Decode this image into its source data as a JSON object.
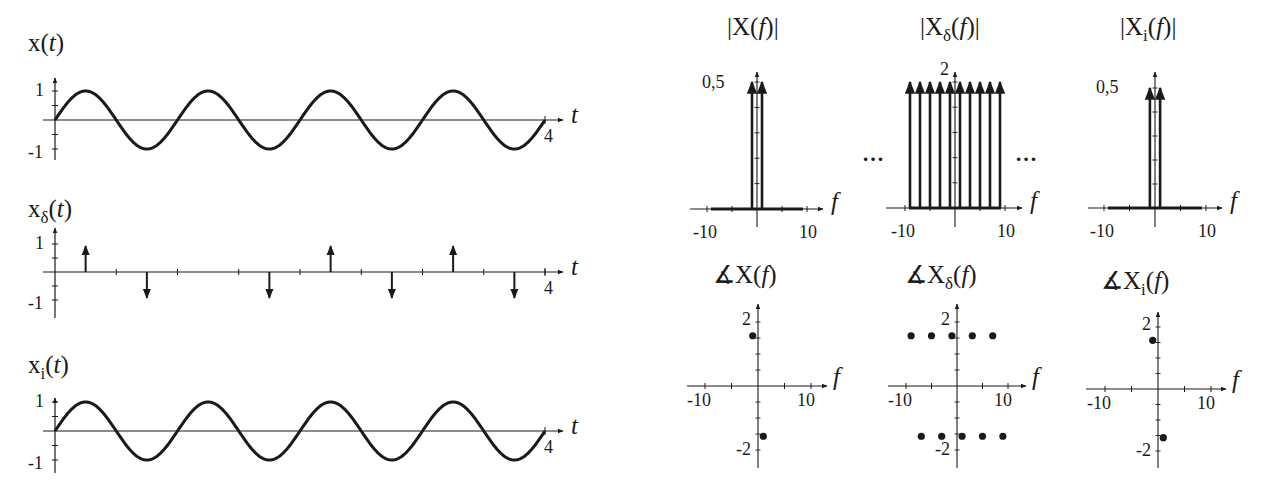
{
  "colors": {
    "ink": "#1a1a1a",
    "axis": "#333333",
    "background": "#ffffff"
  },
  "chart_data": [
    {
      "id": "x_t",
      "type": "line",
      "title": "x(t)",
      "title_base": "x",
      "title_sub": "",
      "title_arg": "t",
      "xlabel": "t",
      "ylabel": "x(t)",
      "xlim": [
        0,
        4
      ],
      "ylim": [
        -1,
        1
      ],
      "x_ticks_labeled": [
        "4"
      ],
      "y_ticks_labeled": [
        "1",
        "-1"
      ],
      "function": "sin(2*pi*1*t)",
      "frequency_hz": 1,
      "amplitude": 1,
      "px": {
        "x0": 55,
        "x1": 545,
        "y0": 120,
        "yUnit": 29,
        "axisEnd": 563,
        "yTop": 78,
        "yBot": 160,
        "titleX": 28,
        "titleY": 30
      }
    },
    {
      "id": "x_delta_t",
      "type": "stem",
      "title": "xδ(t)",
      "title_base": "x",
      "title_sub": "δ",
      "title_arg": "t",
      "xlabel": "t",
      "ylabel": "xδ(t)",
      "xlim": [
        0,
        4
      ],
      "ylim": [
        -1,
        1
      ],
      "x_ticks_labeled": [
        "4"
      ],
      "y_ticks_labeled": [
        "1",
        "-1"
      ],
      "tick_spacing": 0.25,
      "impulses": [
        {
          "t": 0.25,
          "value": 1
        },
        {
          "t": 0.75,
          "value": -1
        },
        {
          "t": 1.75,
          "value": -1
        },
        {
          "t": 2.25,
          "value": 1
        },
        {
          "t": 2.75,
          "value": -1
        },
        {
          "t": 3.25,
          "value": 1
        },
        {
          "t": 3.75,
          "value": -1
        }
      ],
      "px": {
        "x0": 55,
        "x1": 545,
        "y0": 272,
        "yUnit": 28,
        "axisEnd": 563,
        "yTop": 228,
        "yBot": 318,
        "titleX": 28,
        "titleY": 196
      }
    },
    {
      "id": "x_i_t",
      "type": "line",
      "title": "xi(t)",
      "title_base": "x",
      "title_sub": "i",
      "title_arg": "t",
      "xlabel": "t",
      "ylabel": "xi(t)",
      "xlim": [
        0,
        4
      ],
      "ylim": [
        -1,
        1
      ],
      "x_ticks_labeled": [
        "4"
      ],
      "y_ticks_labeled": [
        "1",
        "-1"
      ],
      "function": "sin(2*pi*1*t)",
      "frequency_hz": 1,
      "amplitude": 1,
      "px": {
        "x0": 55,
        "x1": 545,
        "y0": 431,
        "yUnit": 29,
        "axisEnd": 563,
        "yTop": 398,
        "yBot": 473,
        "titleX": 28,
        "titleY": 352
      }
    },
    {
      "id": "mag_X",
      "type": "stem",
      "title": "|X(f)|",
      "title_base": "X",
      "title_sub": "",
      "title_arg": "f",
      "abs": true,
      "xlabel": "f",
      "xlim": [
        -10,
        10
      ],
      "ylim": [
        0,
        0.5
      ],
      "x_ticks_labeled": [
        "-10",
        "10"
      ],
      "y_ticks_labeled": [
        "0,5"
      ],
      "impulses": [
        {
          "f": -1,
          "value": 0.5
        },
        {
          "f": 1,
          "value": 0.5
        }
      ],
      "baseline_band": [
        -9,
        9
      ],
      "px": {
        "x0": 757,
        "fUnit": 5,
        "y0": 209,
        "top": 82,
        "axisTop": 72,
        "axisL": 690,
        "axisR": 823,
        "yBot": 227,
        "titleX": 727,
        "titleY": 14,
        "maxLabelX": 702,
        "maxLabelY": 73
      }
    },
    {
      "id": "mag_Xdelta",
      "type": "stem",
      "title": "|Xδ(f)|",
      "title_base": "X",
      "title_sub": "δ",
      "title_arg": "f",
      "abs": true,
      "xlabel": "f",
      "xlim": [
        -10,
        10
      ],
      "ylim": [
        0,
        2
      ],
      "x_ticks_labeled": [
        "-10",
        "10"
      ],
      "y_ticks_labeled": [
        "2"
      ],
      "impulses": [
        {
          "f": -9,
          "value": 2
        },
        {
          "f": -7,
          "value": 2
        },
        {
          "f": -5,
          "value": 2
        },
        {
          "f": -3,
          "value": 2
        },
        {
          "f": -1,
          "value": 2
        },
        {
          "f": 1,
          "value": 2
        },
        {
          "f": 3,
          "value": 2
        },
        {
          "f": 5,
          "value": 2
        },
        {
          "f": 7,
          "value": 2
        },
        {
          "f": 9,
          "value": 2
        }
      ],
      "continues": "…",
      "baseline_band": [
        -9,
        9
      ],
      "px": {
        "x0": 955,
        "fUnit": 5,
        "y0": 208,
        "top": 82,
        "axisTop": 72,
        "axisL": 886,
        "axisR": 1022,
        "yBot": 227,
        "titleX": 920,
        "titleY": 14,
        "maxLabelX": 940,
        "maxLabelY": 60
      }
    },
    {
      "id": "mag_Xi",
      "type": "stem",
      "title": "|Xi(f)|",
      "title_base": "X",
      "title_sub": "i",
      "title_arg": "f",
      "abs": true,
      "xlabel": "f",
      "xlim": [
        -10,
        10
      ],
      "ylim": [
        0,
        0.5
      ],
      "x_ticks_labeled": [
        "-10",
        "10"
      ],
      "y_ticks_labeled": [
        "0,5"
      ],
      "impulses": [
        {
          "f": -1,
          "value": 0.5
        },
        {
          "f": 1,
          "value": 0.5
        }
      ],
      "baseline_band": [
        -9,
        9
      ],
      "px": {
        "x0": 1155,
        "fUnit": 5.1,
        "y0": 208,
        "top": 88,
        "axisTop": 72,
        "axisL": 1088,
        "axisR": 1222,
        "yBot": 227,
        "titleX": 1120,
        "titleY": 14,
        "maxLabelX": 1096,
        "maxLabelY": 78
      }
    },
    {
      "id": "phase_X",
      "type": "scatter",
      "title": "∡X(f)",
      "title_base": "X",
      "title_sub": "",
      "title_arg": "f",
      "angle": true,
      "xlabel": "f",
      "xlim": [
        -10,
        10
      ],
      "ylim": [
        -2,
        2
      ],
      "x_ticks_labeled": [
        "-10",
        "10"
      ],
      "y_ticks_labeled": [
        "2",
        "-2"
      ],
      "points": [
        {
          "f": -1,
          "phase": 1.57
        },
        {
          "f": 1,
          "phase": -1.57
        }
      ],
      "px": {
        "x0": 758,
        "fUnit": 5.3,
        "y0": 386,
        "yUnit": 32,
        "axisTop": 304,
        "axisBot": 468,
        "axisL": 687,
        "axisR": 827,
        "titleX": 713,
        "titleY": 262
      }
    },
    {
      "id": "phase_Xdelta",
      "type": "scatter",
      "title": "∡Xδ(f)",
      "title_base": "X",
      "title_sub": "δ",
      "title_arg": "f",
      "angle": true,
      "xlabel": "f",
      "xlim": [
        -10,
        10
      ],
      "ylim": [
        -2,
        2
      ],
      "x_ticks_labeled": [
        "-10",
        "10"
      ],
      "y_ticks_labeled": [
        "2",
        "-2"
      ],
      "points": [
        {
          "f": -9,
          "phase": 1.57
        },
        {
          "f": -5,
          "phase": 1.57
        },
        {
          "f": -1,
          "phase": 1.57
        },
        {
          "f": 3,
          "phase": 1.57
        },
        {
          "f": 7,
          "phase": 1.57
        },
        {
          "f": -7,
          "phase": -1.57
        },
        {
          "f": -3,
          "phase": -1.57
        },
        {
          "f": 1,
          "phase": -1.57
        },
        {
          "f": 5,
          "phase": -1.57
        },
        {
          "f": 9,
          "phase": -1.57
        }
      ],
      "px": {
        "x0": 957,
        "fUnit": 5.1,
        "y0": 386,
        "yUnit": 32,
        "axisTop": 304,
        "axisBot": 468,
        "axisL": 888,
        "axisR": 1026,
        "titleX": 905,
        "titleY": 262
      }
    },
    {
      "id": "phase_Xi",
      "type": "scatter",
      "title": "∡Xi(f)",
      "title_base": "X",
      "title_sub": "i",
      "title_arg": "f",
      "angle": true,
      "xlabel": "f",
      "xlim": [
        -10,
        10
      ],
      "ylim": [
        -2,
        2
      ],
      "x_ticks_labeled": [
        "-10",
        "10"
      ],
      "y_ticks_labeled": [
        "2",
        "-2"
      ],
      "points": [
        {
          "f": -1,
          "phase": 1.57
        },
        {
          "f": 1,
          "phase": -1.57
        }
      ],
      "px": {
        "x0": 1158,
        "fUnit": 5.3,
        "y0": 389,
        "yUnit": 31,
        "axisTop": 312,
        "axisBot": 468,
        "axisL": 1086,
        "axisR": 1226,
        "titleX": 1101,
        "titleY": 268
      }
    }
  ]
}
